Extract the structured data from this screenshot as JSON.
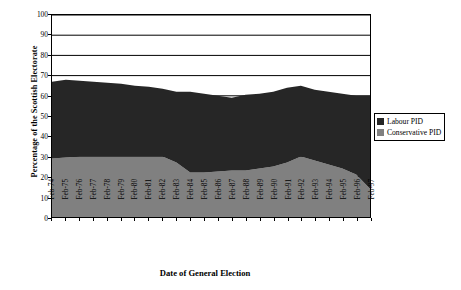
{
  "chart_data": {
    "type": "area",
    "stacked": true,
    "title": "",
    "xlabel": "Date  of General Election",
    "ylabel": "Percentage of the Scottish Electorate",
    "ylim": [
      0,
      100
    ],
    "yticks": [
      0,
      10,
      20,
      30,
      40,
      50,
      60,
      70,
      80,
      90,
      100
    ],
    "grid": "horizontal",
    "legend_position": "right",
    "categories": [
      "Feb-74",
      "Feb-75",
      "Feb-76",
      "Feb-77",
      "Feb-78",
      "Feb-79",
      "Feb-80",
      "Feb-81",
      "Feb-82",
      "Feb-83",
      "Feb-84",
      "Feb-85",
      "Feb-86",
      "Feb-87",
      "Feb-88",
      "Feb-89",
      "Feb-90",
      "Feb-91",
      "Feb-92",
      "Feb-93",
      "Feb-94",
      "Feb-95",
      "Feb-96",
      "Feb-97"
    ],
    "series": [
      {
        "name": "Conservative PID",
        "color": "#808080",
        "values": [
          29,
          29.5,
          30,
          30,
          30,
          30,
          30,
          30,
          30,
          27,
          22,
          22,
          22.5,
          23,
          23,
          24,
          25,
          27,
          30,
          28,
          26,
          24,
          21,
          14
        ]
      },
      {
        "name": "Labour PID",
        "color": "#262626",
        "values": [
          38,
          38.5,
          37.5,
          37,
          36.5,
          36,
          35,
          34.5,
          33.5,
          35,
          40,
          39,
          37.5,
          36,
          37.5,
          37,
          37,
          37,
          35,
          35,
          36,
          37,
          39,
          46
        ]
      }
    ],
    "totals": [
      67,
      68,
      67.5,
      67,
      66.5,
      66,
      65,
      64.5,
      63.5,
      62,
      62,
      61,
      60,
      59,
      60.5,
      61,
      62,
      64,
      65,
      63,
      62,
      61,
      60,
      60
    ]
  },
  "legend": {
    "items": [
      {
        "label": "Labour PID",
        "color": "#262626"
      },
      {
        "label": "Conservative PID",
        "color": "#808080"
      }
    ]
  },
  "axes": {
    "y_title": "Percentage of the Scottish Electorate",
    "x_title": "Date  of General Election"
  }
}
